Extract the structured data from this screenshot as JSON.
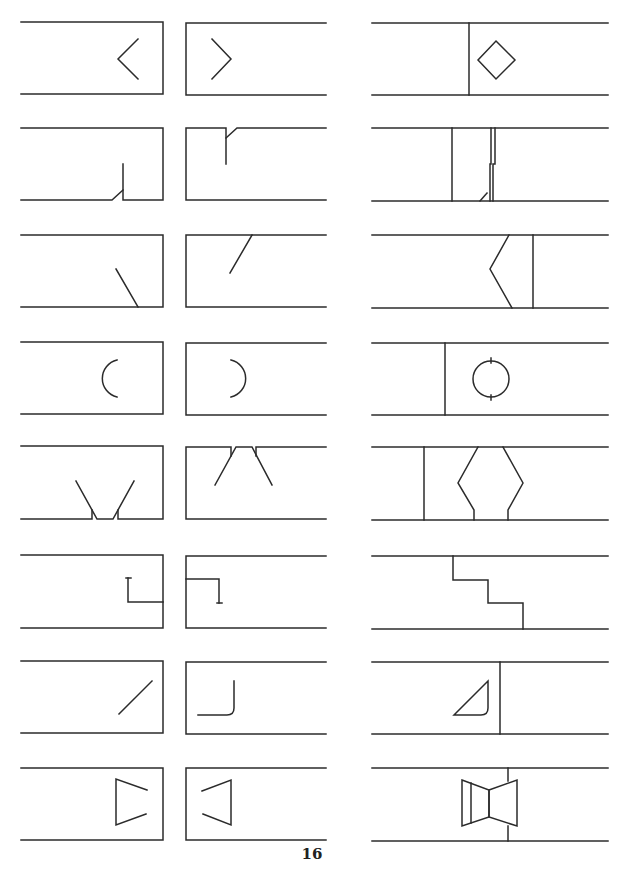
{
  "page": {
    "page_number": "16",
    "stroke_color": "#2b2b2b",
    "background": "#ffffff"
  },
  "symbols": [
    {
      "id": "r1-left",
      "name": "duct-end-chevron-left-icon",
      "row": 1,
      "col": 1,
      "box": {
        "x": 21,
        "y": 22,
        "w": 142,
        "h": 72
      }
    },
    {
      "id": "r1-mid",
      "name": "duct-end-chevron-right-icon",
      "row": 1,
      "col": 2,
      "box": {
        "x": 186,
        "y": 22,
        "w": 140,
        "h": 72
      }
    },
    {
      "id": "r1-right",
      "name": "duct-diamond-damper-icon",
      "row": 1,
      "col": 3,
      "box": {
        "x": 372,
        "y": 22,
        "w": 236,
        "h": 72
      }
    },
    {
      "id": "r2-left",
      "name": "duct-end-bottom-notch-icon",
      "row": 2,
      "col": 1,
      "box": {
        "x": 21,
        "y": 128,
        "w": 142,
        "h": 72
      }
    },
    {
      "id": "r2-mid",
      "name": "duct-end-top-notch-icon",
      "row": 2,
      "col": 2,
      "box": {
        "x": 186,
        "y": 128,
        "w": 140,
        "h": 72
      }
    },
    {
      "id": "r2-right",
      "name": "duct-joint-offset-icon",
      "row": 2,
      "col": 3,
      "box": {
        "x": 372,
        "y": 128,
        "w": 236,
        "h": 72
      }
    },
    {
      "id": "r3-left",
      "name": "duct-end-diagonal-down-icon",
      "row": 3,
      "col": 1,
      "box": {
        "x": 21,
        "y": 235,
        "w": 142,
        "h": 72
      }
    },
    {
      "id": "r3-mid",
      "name": "duct-end-diagonal-up-icon",
      "row": 3,
      "col": 2,
      "box": {
        "x": 186,
        "y": 235,
        "w": 140,
        "h": 72
      }
    },
    {
      "id": "r3-right",
      "name": "duct-angled-transition-icon",
      "row": 3,
      "col": 3,
      "box": {
        "x": 372,
        "y": 235,
        "w": 236,
        "h": 72
      }
    },
    {
      "id": "r4-left",
      "name": "duct-end-arc-left-icon",
      "row": 4,
      "col": 1,
      "box": {
        "x": 21,
        "y": 342,
        "w": 142,
        "h": 72
      }
    },
    {
      "id": "r4-mid",
      "name": "duct-end-arc-right-icon",
      "row": 4,
      "col": 2,
      "box": {
        "x": 186,
        "y": 342,
        "w": 140,
        "h": 72
      }
    },
    {
      "id": "r4-right",
      "name": "duct-circle-damper-icon",
      "row": 4,
      "col": 3,
      "box": {
        "x": 372,
        "y": 342,
        "w": 236,
        "h": 72
      }
    },
    {
      "id": "r5-left",
      "name": "duct-end-v-bottom-icon",
      "row": 5,
      "col": 1,
      "box": {
        "x": 21,
        "y": 446,
        "w": 142,
        "h": 72
      }
    },
    {
      "id": "r5-mid",
      "name": "duct-end-v-top-icon",
      "row": 5,
      "col": 2,
      "box": {
        "x": 186,
        "y": 446,
        "w": 140,
        "h": 72
      }
    },
    {
      "id": "r5-right",
      "name": "duct-hexagon-fitting-icon",
      "row": 5,
      "col": 3,
      "box": {
        "x": 372,
        "y": 446,
        "w": 236,
        "h": 72
      }
    },
    {
      "id": "r6-left",
      "name": "duct-end-l-hook-left-icon",
      "row": 6,
      "col": 1,
      "box": {
        "x": 21,
        "y": 555,
        "w": 142,
        "h": 72
      }
    },
    {
      "id": "r6-mid",
      "name": "duct-end-l-hook-right-icon",
      "row": 6,
      "col": 2,
      "box": {
        "x": 186,
        "y": 555,
        "w": 140,
        "h": 72
      }
    },
    {
      "id": "r6-right",
      "name": "duct-stepped-joint-icon",
      "row": 6,
      "col": 3,
      "box": {
        "x": 372,
        "y": 555,
        "w": 236,
        "h": 72
      }
    },
    {
      "id": "r7-left",
      "name": "duct-end-slash-icon",
      "row": 7,
      "col": 1,
      "box": {
        "x": 21,
        "y": 661,
        "w": 142,
        "h": 72
      }
    },
    {
      "id": "r7-mid",
      "name": "duct-end-rounded-corner-icon",
      "row": 7,
      "col": 2,
      "box": {
        "x": 186,
        "y": 661,
        "w": 140,
        "h": 72
      }
    },
    {
      "id": "r7-right",
      "name": "duct-triangle-vane-icon",
      "row": 7,
      "col": 3,
      "box": {
        "x": 372,
        "y": 661,
        "w": 236,
        "h": 72
      }
    },
    {
      "id": "r8-left",
      "name": "duct-end-trapezoid-open-right-icon",
      "row": 8,
      "col": 1,
      "box": {
        "x": 21,
        "y": 768,
        "w": 142,
        "h": 72
      }
    },
    {
      "id": "r8-mid",
      "name": "duct-end-trapezoid-open-left-icon",
      "row": 8,
      "col": 2,
      "box": {
        "x": 186,
        "y": 768,
        "w": 140,
        "h": 72
      }
    },
    {
      "id": "r8-right",
      "name": "duct-bowtie-fitting-icon",
      "row": 8,
      "col": 3,
      "box": {
        "x": 372,
        "y": 768,
        "w": 236,
        "h": 72
      }
    }
  ]
}
